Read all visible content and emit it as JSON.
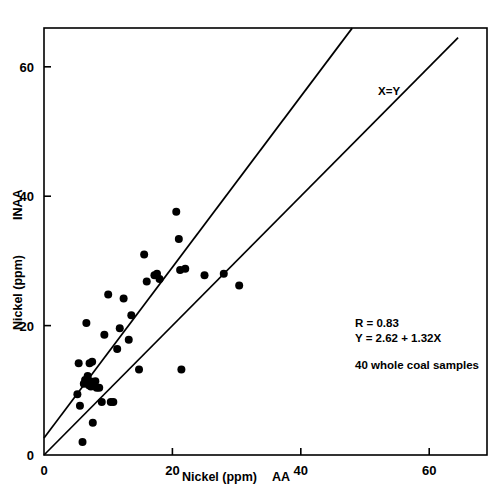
{
  "chart_data": {
    "type": "scatter",
    "title": "",
    "xlabel": "Nickel (ppm)        AA",
    "xlabel_main": "Nickel (ppm)",
    "xlabel_method": "AA",
    "ylabel": "Nickel (ppm)",
    "ylabel_method": "INAA",
    "xlim": [
      0,
      69
    ],
    "ylim": [
      0,
      66
    ],
    "xticks": [
      0,
      20,
      40,
      60
    ],
    "xtick_labels": [
      "0",
      "20",
      "40",
      "60"
    ],
    "yticks": [
      0,
      20,
      40,
      60
    ],
    "ytick_labels": [
      "0",
      "20",
      "40",
      "60"
    ],
    "grid": false,
    "legend": "none",
    "marker": "filled-circle",
    "marker_color": "#000000",
    "frame_color": "#000000",
    "x": [
      5.2,
      5.4,
      5.6,
      6.0,
      6.2,
      6.4,
      6.6,
      6.8,
      7.0,
      7.1,
      7.2,
      7.3,
      7.5,
      7.6,
      7.8,
      8.0,
      8.2,
      8.6,
      9.0,
      9.4,
      10.0,
      10.4,
      10.8,
      11.4,
      11.8,
      12.4,
      13.2,
      13.6,
      14.8,
      15.6,
      16.0,
      17.2,
      17.6,
      18.0,
      20.6,
      21.0,
      21.2,
      21.4,
      22.0,
      25.0,
      28.0,
      30.4
    ],
    "y": [
      9.4,
      14.2,
      7.6,
      2.0,
      11.0,
      11.6,
      20.4,
      12.2,
      10.8,
      14.2,
      11.4,
      10.6,
      14.4,
      5.0,
      11.0,
      11.4,
      10.4,
      10.4,
      8.2,
      18.6,
      24.8,
      8.2,
      8.2,
      16.4,
      19.6,
      24.2,
      17.8,
      21.6,
      13.2,
      31.0,
      26.8,
      27.8,
      28.0,
      27.2,
      37.6,
      33.4,
      28.6,
      13.2,
      28.8,
      27.8,
      28.0,
      26.2
    ],
    "points": [
      {
        "x": 5.2,
        "y": 9.4
      },
      {
        "x": 5.4,
        "y": 14.2
      },
      {
        "x": 5.6,
        "y": 7.6
      },
      {
        "x": 6.0,
        "y": 2.0
      },
      {
        "x": 6.2,
        "y": 11.0
      },
      {
        "x": 6.4,
        "y": 11.6
      },
      {
        "x": 6.6,
        "y": 20.4
      },
      {
        "x": 6.8,
        "y": 12.2
      },
      {
        "x": 7.0,
        "y": 10.8
      },
      {
        "x": 7.1,
        "y": 14.2
      },
      {
        "x": 7.2,
        "y": 11.4
      },
      {
        "x": 7.3,
        "y": 10.6
      },
      {
        "x": 7.5,
        "y": 14.4
      },
      {
        "x": 7.6,
        "y": 5.0
      },
      {
        "x": 7.8,
        "y": 11.0
      },
      {
        "x": 8.0,
        "y": 11.4
      },
      {
        "x": 8.2,
        "y": 10.4
      },
      {
        "x": 8.6,
        "y": 10.4
      },
      {
        "x": 9.0,
        "y": 8.2
      },
      {
        "x": 9.4,
        "y": 18.6
      },
      {
        "x": 10.0,
        "y": 24.8
      },
      {
        "x": 10.4,
        "y": 8.2
      },
      {
        "x": 10.8,
        "y": 8.2
      },
      {
        "x": 11.4,
        "y": 16.4
      },
      {
        "x": 11.8,
        "y": 19.6
      },
      {
        "x": 12.4,
        "y": 24.2
      },
      {
        "x": 13.2,
        "y": 17.8
      },
      {
        "x": 13.6,
        "y": 21.6
      },
      {
        "x": 14.8,
        "y": 13.2
      },
      {
        "x": 15.6,
        "y": 31.0
      },
      {
        "x": 16.0,
        "y": 26.8
      },
      {
        "x": 17.2,
        "y": 27.8
      },
      {
        "x": 17.6,
        "y": 28.0
      },
      {
        "x": 18.0,
        "y": 27.2
      },
      {
        "x": 20.6,
        "y": 37.6
      },
      {
        "x": 21.0,
        "y": 33.4
      },
      {
        "x": 21.2,
        "y": 28.6
      },
      {
        "x": 21.4,
        "y": 13.2
      },
      {
        "x": 22.0,
        "y": 28.8
      },
      {
        "x": 25.0,
        "y": 27.8
      },
      {
        "x": 28.0,
        "y": 28.0
      },
      {
        "x": 30.4,
        "y": 26.2
      }
    ],
    "lines": [
      {
        "name": "regression",
        "label": "",
        "equation": "Y = 2.62 + 1.32X",
        "intercept": 2.62,
        "slope": 1.32,
        "x_start": 0.0,
        "x_end": 48.0
      },
      {
        "name": "identity",
        "label": "X=Y",
        "equation": "Y = X",
        "intercept": 0.0,
        "slope": 1.0,
        "x_start": 0.0,
        "x_end": 64.5
      }
    ],
    "annotations": [
      {
        "name": "correlation",
        "text": "R = 0.83",
        "x": 41.5,
        "y": 20.5
      },
      {
        "name": "regression-equation",
        "text": "Y = 2.62 + 1.32X",
        "x": 41.5,
        "y": 18.4
      },
      {
        "name": "sample-count",
        "text": "40 whole coal samples",
        "x": 41.5,
        "y": 14.6
      },
      {
        "name": "identity-line-label",
        "text": "X=Y",
        "x": 54.0,
        "y": 56.5
      }
    ]
  },
  "axes": {
    "x_ticks": [
      "0",
      "20",
      "40",
      "60"
    ],
    "y_ticks": [
      "0",
      "20",
      "40",
      "60"
    ],
    "x_title_main": "Nickel (ppm)",
    "x_title_method": "AA",
    "y_title_main": "Nickel (ppm)",
    "y_title_method": "INAA"
  },
  "annotations": {
    "correlation": "R = 0.83",
    "equation": "Y = 2.62 + 1.32X",
    "samples": "40 whole coal samples",
    "identity_label": "X=Y"
  }
}
